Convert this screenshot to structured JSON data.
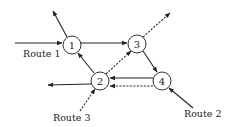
{
  "diagram": {
    "type": "network-routes",
    "nodes": [
      {
        "id": "1",
        "label": "1",
        "x": 72,
        "y": 45
      },
      {
        "id": "2",
        "label": "2",
        "x": 100,
        "y": 81
      },
      {
        "id": "3",
        "label": "3",
        "x": 137,
        "y": 44
      },
      {
        "id": "4",
        "label": "4",
        "x": 162,
        "y": 81
      }
    ],
    "routes": [
      {
        "name": "Route 1",
        "label": "Route 1",
        "style": "solid",
        "path": [
          "entry-left",
          "1",
          "3",
          "4",
          "2",
          "exit-left"
        ]
      },
      {
        "name": "Route 2",
        "label": "Route 2",
        "style": "solid",
        "path": [
          "entry-bottom-right",
          "4",
          "2",
          "1",
          "exit-top-left"
        ]
      },
      {
        "name": "Route 3",
        "label": "Route 3",
        "style": "dashed",
        "path": [
          "entry-bottom-left",
          "2",
          "3",
          "exit-top-right"
        ]
      }
    ],
    "labels": {
      "route1": "Route 1",
      "route2": "Route 2",
      "route3": "Route 3",
      "node1": "1",
      "node2": "2",
      "node3": "3",
      "node4": "4"
    },
    "colors": {
      "line": "#222222",
      "background": "#ffffff"
    }
  }
}
